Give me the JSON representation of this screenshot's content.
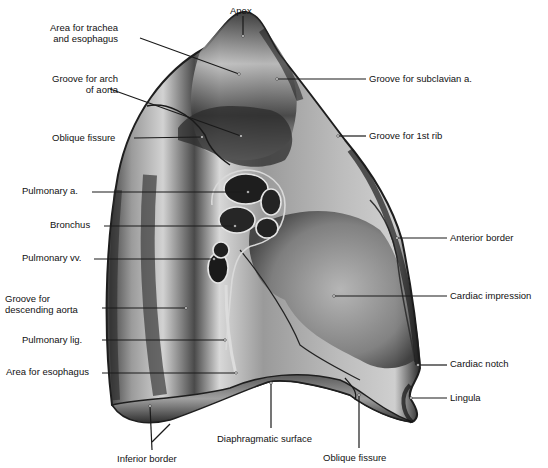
{
  "figure": {
    "background": "#ffffff",
    "colors": {
      "ink": "#111111",
      "lung_light": "#c9c9c9",
      "lung_mid": "#8a8a8a",
      "lung_dark": "#2b2b2b",
      "leader": "#1a1a1a"
    }
  },
  "labels": [
    {
      "id": "apex",
      "lines": [
        "Apex"
      ],
      "x": 230,
      "y": 5,
      "align": "center",
      "anchor": [
        243,
        36
      ],
      "leader_from": [
        243,
        16
      ]
    },
    {
      "id": "area-trachea-esophagus",
      "lines": [
        "Area for trachea",
        "and esophagus"
      ],
      "x": 50,
      "y": 22,
      "align": "right",
      "anchor": [
        239,
        74
      ],
      "leader_from": [
        140,
        38
      ]
    },
    {
      "id": "groove-arch-aorta",
      "lines": [
        "Groove for arch",
        "of aorta"
      ],
      "x": 52,
      "y": 73,
      "align": "right",
      "anchor": [
        241,
        136
      ],
      "leader_from": [
        110,
        89
      ]
    },
    {
      "id": "oblique-fissure-top",
      "lines": [
        "Oblique fissure"
      ],
      "x": 52,
      "y": 132,
      "align": "right",
      "anchor": [
        202,
        137
      ],
      "leader_from": [
        134,
        138
      ]
    },
    {
      "id": "groove-subclavian",
      "lines": [
        "Groove for subclavian a."
      ],
      "x": 369,
      "y": 73,
      "align": "left",
      "anchor": [
        277,
        79
      ],
      "leader_from": [
        366,
        79
      ]
    },
    {
      "id": "groove-1st-rib",
      "lines": [
        "Groove for 1st rib"
      ],
      "x": 369,
      "y": 130,
      "align": "left",
      "anchor": [
        338,
        136
      ],
      "leader_from": [
        366,
        136
      ]
    },
    {
      "id": "pulmonary-artery",
      "lines": [
        "Pulmonary a."
      ],
      "x": 22,
      "y": 185,
      "align": "right",
      "anchor": [
        248,
        192
      ],
      "leader_from": [
        92,
        192
      ]
    },
    {
      "id": "bronchus",
      "lines": [
        "Bronchus"
      ],
      "x": 50,
      "y": 219,
      "align": "right",
      "anchor": [
        235,
        226
      ],
      "leader_from": [
        104,
        226
      ]
    },
    {
      "id": "pulmonary-veins",
      "lines": [
        "Pulmonary vv."
      ],
      "x": 22,
      "y": 252,
      "align": "right",
      "anchor": [
        214,
        259
      ],
      "leader_from": [
        94,
        259
      ]
    },
    {
      "id": "groove-descending-aorta",
      "lines": [
        "Groove for",
        "descending aorta"
      ],
      "x": 5,
      "y": 293,
      "align": "left",
      "anchor": [
        186,
        308
      ],
      "leader_from": [
        102,
        308
      ]
    },
    {
      "id": "pulmonary-ligament",
      "lines": [
        "Pulmonary lig."
      ],
      "x": 22,
      "y": 334,
      "align": "right",
      "anchor": [
        225,
        340
      ],
      "leader_from": [
        102,
        340
      ]
    },
    {
      "id": "area-esophagus",
      "lines": [
        "Area for esophagus"
      ],
      "x": 6,
      "y": 366,
      "align": "right",
      "anchor": [
        236,
        373
      ],
      "leader_from": [
        102,
        373
      ]
    },
    {
      "id": "inferior-border",
      "lines": [
        "Inferior border"
      ],
      "x": 117,
      "y": 453,
      "align": "center",
      "anchor": [
        150,
        406
      ],
      "leader_from": [
        152,
        450
      ],
      "extra_anchor": [
        170,
        424
      ]
    },
    {
      "id": "diaphragmatic-surface",
      "lines": [
        "Diaphragmatic surface"
      ],
      "x": 217,
      "y": 433,
      "align": "left",
      "anchor": [
        271,
        383
      ],
      "leader_from": [
        271,
        428
      ]
    },
    {
      "id": "oblique-fissure-bottom",
      "lines": [
        "Oblique fissure"
      ],
      "x": 323,
      "y": 452,
      "align": "left",
      "anchor": [
        359,
        395
      ],
      "leader_from": [
        359,
        448
      ]
    },
    {
      "id": "anterior-border",
      "lines": [
        "Anterior border"
      ],
      "x": 450,
      "y": 232,
      "align": "left",
      "anchor": [
        397,
        238
      ],
      "leader_from": [
        447,
        238
      ]
    },
    {
      "id": "cardiac-impression",
      "lines": [
        "Cardiac impression"
      ],
      "x": 450,
      "y": 290,
      "align": "left",
      "anchor": [
        334,
        296
      ],
      "leader_from": [
        447,
        296
      ]
    },
    {
      "id": "cardiac-notch",
      "lines": [
        "Cardiac notch"
      ],
      "x": 450,
      "y": 358,
      "align": "left",
      "anchor": [
        418,
        365
      ],
      "leader_from": [
        447,
        365
      ]
    },
    {
      "id": "lingula",
      "lines": [
        "Lingula"
      ],
      "x": 450,
      "y": 392,
      "align": "left",
      "anchor": [
        411,
        398
      ],
      "leader_from": [
        447,
        398
      ]
    }
  ]
}
